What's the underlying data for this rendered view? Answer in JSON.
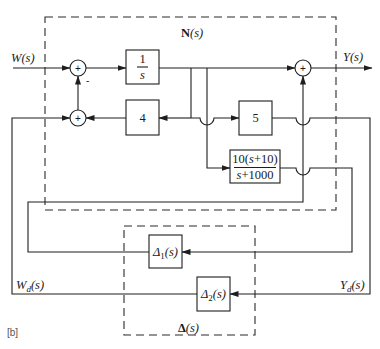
{
  "figure": {
    "label": "[b]"
  },
  "signals": {
    "input": {
      "name": "W",
      "arg": "(s)"
    },
    "output": {
      "name": "Y",
      "arg": "(s)"
    },
    "uncertainty_input": {
      "name": "W",
      "sub": "d",
      "arg": "(s)"
    },
    "uncertainty_output": {
      "name": "Y",
      "sub": "d",
      "arg": "(s)"
    }
  },
  "subsystems": {
    "nominal": {
      "name": "N",
      "arg": "(s)"
    },
    "uncertainty": {
      "name": "Δ",
      "arg": "(s)"
    }
  },
  "blocks": {
    "integrator": {
      "num": "1",
      "den": "s"
    },
    "gain_feedback": {
      "value": "4"
    },
    "gain_forward": {
      "value": "5"
    },
    "filter": {
      "num": {
        "a": "10(",
        "s": "s",
        "b": "+10)"
      },
      "den": {
        "s": "s",
        "b": "+1000"
      }
    },
    "delta1": {
      "name": "Δ",
      "sub": "1",
      "arg": "(s)"
    },
    "delta2": {
      "name": "Δ",
      "sub": "2",
      "arg": "(s)"
    }
  },
  "summers": {
    "upper": {
      "sign": "+",
      "feedback_sign": "-"
    },
    "lower": {
      "sign": "+"
    },
    "output": {
      "sign": "+"
    }
  },
  "colors": {
    "line": "#1e1e1e",
    "background": "#ffffff"
  }
}
